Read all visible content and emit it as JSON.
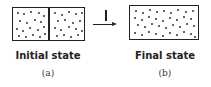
{
  "diagram": {
    "initial": {
      "title": "Initial state",
      "sublabel": "(a)",
      "left_dots": [
        [
          4,
          4
        ],
        [
          10,
          5
        ],
        [
          17,
          3
        ],
        [
          25,
          4
        ],
        [
          30,
          7
        ],
        [
          6,
          12
        ],
        [
          13,
          14
        ],
        [
          21,
          11
        ],
        [
          27,
          13
        ],
        [
          3,
          20
        ],
        [
          9,
          22
        ],
        [
          16,
          19
        ],
        [
          24,
          21
        ],
        [
          30,
          18
        ],
        [
          5,
          27
        ],
        [
          12,
          28
        ],
        [
          19,
          26
        ],
        [
          26,
          28
        ],
        [
          31,
          25
        ]
      ],
      "right_dots": [
        [
          4,
          4
        ],
        [
          11,
          6
        ],
        [
          18,
          3
        ],
        [
          25,
          5
        ],
        [
          31,
          4
        ],
        [
          7,
          12
        ],
        [
          14,
          11
        ],
        [
          22,
          14
        ],
        [
          29,
          12
        ],
        [
          4,
          19
        ],
        [
          10,
          21
        ],
        [
          18,
          18
        ],
        [
          25,
          20
        ],
        [
          31,
          22
        ],
        [
          6,
          27
        ],
        [
          13,
          26
        ],
        [
          20,
          28
        ],
        [
          27,
          26
        ]
      ]
    },
    "process": {
      "label": "I"
    },
    "final": {
      "title": "Final state",
      "sublabel": "(b)",
      "dots": [
        [
          5,
          4
        ],
        [
          12,
          6
        ],
        [
          19,
          3
        ],
        [
          26,
          5
        ],
        [
          33,
          4
        ],
        [
          40,
          6
        ],
        [
          47,
          3
        ],
        [
          55,
          5
        ],
        [
          62,
          4
        ],
        [
          4,
          11
        ],
        [
          11,
          13
        ],
        [
          18,
          10
        ],
        [
          25,
          12
        ],
        [
          32,
          14
        ],
        [
          39,
          11
        ],
        [
          46,
          13
        ],
        [
          53,
          10
        ],
        [
          60,
          12
        ],
        [
          7,
          18
        ],
        [
          14,
          20
        ],
        [
          21,
          17
        ],
        [
          28,
          19
        ],
        [
          35,
          21
        ],
        [
          42,
          18
        ],
        [
          49,
          20
        ],
        [
          56,
          17
        ],
        [
          63,
          19
        ],
        [
          4,
          26
        ],
        [
          11,
          28
        ],
        [
          18,
          25
        ],
        [
          25,
          27
        ],
        [
          32,
          29
        ],
        [
          39,
          26
        ],
        [
          46,
          28
        ],
        [
          53,
          25
        ],
        [
          60,
          27
        ],
        [
          64,
          30
        ]
      ]
    }
  }
}
